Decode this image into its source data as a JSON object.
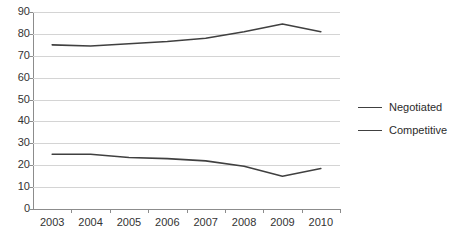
{
  "chart_data": {
    "type": "line",
    "title": "",
    "xlabel": "",
    "ylabel": "",
    "categories": [
      "2003",
      "2004",
      "2005",
      "2006",
      "2007",
      "2008",
      "2009",
      "2010"
    ],
    "series": [
      {
        "name": "Negotiated",
        "values": [
          75,
          74.5,
          75.5,
          76.5,
          78,
          81,
          84.5,
          81
        ]
      },
      {
        "name": "Competitive",
        "values": [
          25,
          25,
          23.5,
          23,
          22,
          19.5,
          15,
          18.5
        ]
      }
    ],
    "ylim": [
      0,
      90
    ],
    "ytick_step": 10,
    "yticks": [
      "90",
      "80",
      "70",
      "60",
      "50",
      "40",
      "30",
      "20",
      "10",
      "0"
    ],
    "grid": true,
    "legend_position": "right",
    "line_color": "#404040",
    "grid_color": "#d4d4d4",
    "axis_color": "#8c8c8c",
    "background_color": "#ffffff"
  },
  "legend": {
    "items": [
      {
        "label": "Negotiated"
      },
      {
        "label": "Competitive"
      }
    ]
  }
}
